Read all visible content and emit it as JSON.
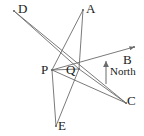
{
  "figure": {
    "type": "geometry-diagram",
    "background_color": "#ffffff",
    "stroke_color": "#6b6b6b",
    "label_color": "#1a1a1a",
    "width": 144,
    "height": 136,
    "points": [
      {
        "id": "D",
        "label": "D",
        "x": 14,
        "y": 11,
        "label_x": 18,
        "label_y": 2
      },
      {
        "id": "A",
        "label": "A",
        "x": 83,
        "y": 10,
        "label_x": 86,
        "label_y": 2
      },
      {
        "id": "B",
        "label": "B",
        "x": 134,
        "y": 47,
        "label_x": 123,
        "label_y": 53
      },
      {
        "id": "C",
        "label": "C",
        "x": 126,
        "y": 103,
        "label_x": 127,
        "label_y": 94
      },
      {
        "id": "P",
        "label": "P",
        "x": 52,
        "y": 70,
        "label_x": 41,
        "label_y": 63
      },
      {
        "id": "Q",
        "label": "Q",
        "x": 79,
        "y": 69,
        "label_x": 66,
        "label_y": 63
      },
      {
        "id": "E",
        "label": "E",
        "x": 56,
        "y": 126,
        "label_x": 58,
        "label_y": 119
      }
    ],
    "segments": [
      {
        "from": "D",
        "to": "Q",
        "name": "segment-d-q"
      },
      {
        "from": "D",
        "to": "C",
        "name": "segment-d-c"
      },
      {
        "from": "A",
        "to": "Q",
        "name": "segment-a-q"
      },
      {
        "from": "A",
        "to": "P",
        "name": "segment-a-p"
      },
      {
        "from": "P",
        "to": "Q",
        "name": "segment-p-q"
      },
      {
        "from": "P",
        "to": "E",
        "name": "segment-p-e"
      },
      {
        "from": "Q",
        "to": "E",
        "name": "segment-q-e"
      },
      {
        "from": "P",
        "to": "C",
        "name": "segment-p-c"
      },
      {
        "from": "P",
        "to": "B",
        "name": "segment-p-b-ray"
      },
      {
        "from": "Q",
        "to": "C",
        "name": "segment-q-c"
      }
    ],
    "north_arrow": {
      "label": "North",
      "x": 106,
      "y_tail": 84,
      "y_head": 61,
      "label_x": 110,
      "label_y": 66
    }
  }
}
